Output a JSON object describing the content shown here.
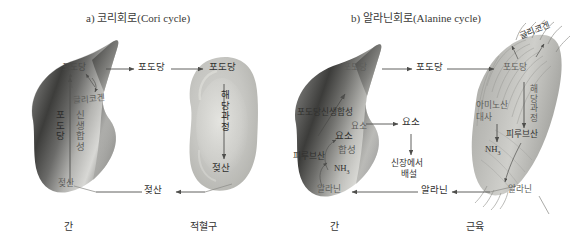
{
  "figure": {
    "type": "biology-diagram",
    "background_color": "#ffffff",
    "ink_color": "#30302e"
  },
  "panel_a": {
    "title": "a) 코리회로(Cori cycle)",
    "left_organ_label": "간",
    "right_organ_label": "적혈구",
    "liver": {
      "top_metabolite": "포도당",
      "glycogen": "글리코겐",
      "pathway_col1": "포도당",
      "pathway_col2": "신생합성",
      "bottom_metabolite": "젖산"
    },
    "transport_glucose_top": "포도당",
    "transport_lactate_bottom": "젖산",
    "rbc": {
      "top_metabolite": "포도당",
      "pathway": "해당과정",
      "bottom_metabolite": "젖산"
    }
  },
  "panel_b": {
    "title": "b) 알라닌회로(Alanine cycle)",
    "left_organ_label": "간",
    "right_organ_label": "근육",
    "liver": {
      "top_metabolite": "포도당",
      "gluconeogenesis": "포도당신생합성",
      "urea_inner": "요소",
      "urea_synthesis_1": "요소",
      "urea_synthesis_2": "합성",
      "pyruvate": "피루브산",
      "ammonia": "NH",
      "ammonia_sub": "3",
      "alanine": "알라닌"
    },
    "transport_glucose_top": "포도당",
    "urea_transport": "요소",
    "kidney_excretion_line1": "신장에서",
    "kidney_excretion_line2": "배설",
    "transport_alanine_bottom": "알라닌",
    "muscle": {
      "glycogen": "글리코겐",
      "top_metabolite": "포도당",
      "pathway": "해당과정",
      "amino_acid_line1": "아미노산",
      "amino_acid_line2": "대사",
      "ammonia": "NH",
      "ammonia_sub": "3",
      "pyruvate": "피루브산",
      "alanine": "알라닌"
    }
  }
}
